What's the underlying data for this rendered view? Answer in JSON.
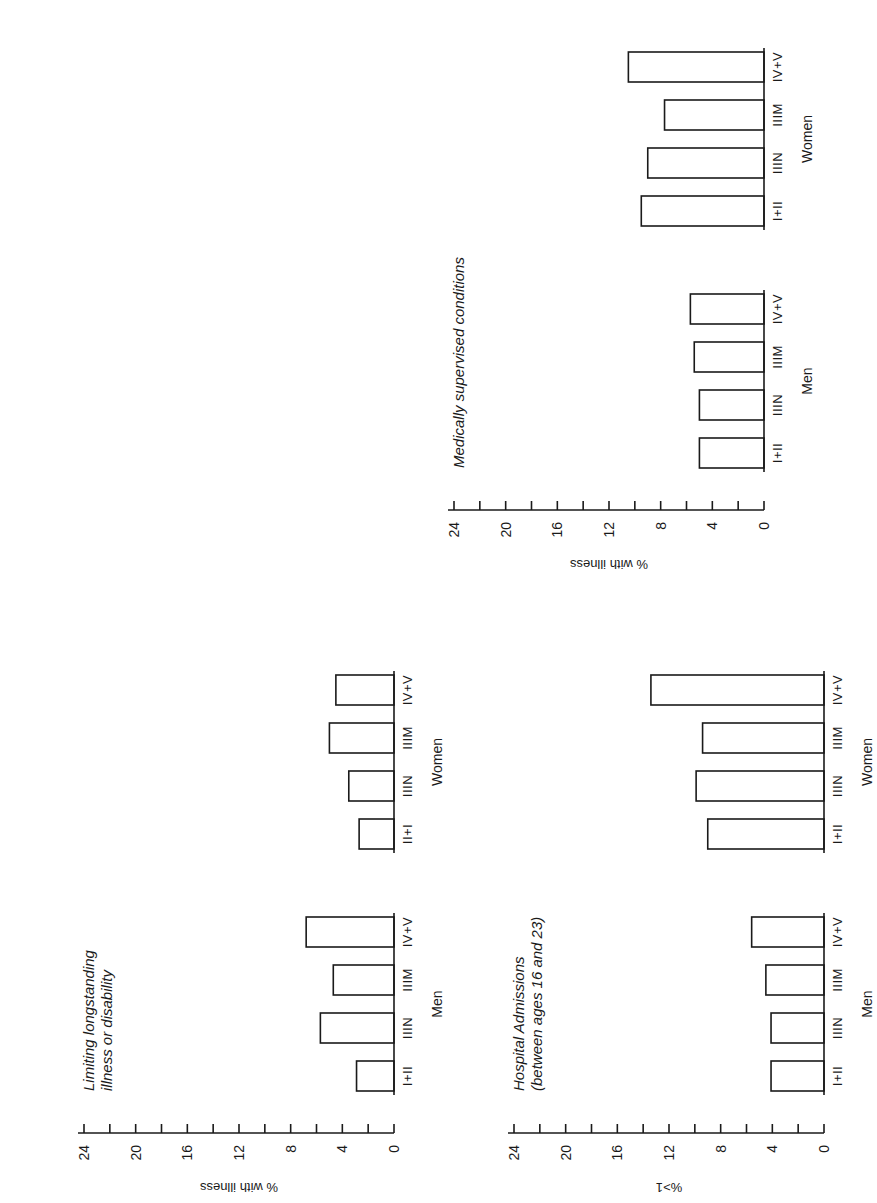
{
  "colors": {
    "ink": "#1a1a1a",
    "background": "#ffffff",
    "bar_fill": "#ffffff"
  },
  "chart_data": [
    {
      "type": "bar",
      "title": "Medically supervised conditions",
      "ylabel": "% with illness",
      "xlabel": "",
      "ylim": [
        0,
        24
      ],
      "yticks": [
        0,
        4,
        8,
        12,
        16,
        20,
        24
      ],
      "minor_tick_step": 2,
      "grid": false,
      "groups": [
        "Men",
        "Women"
      ],
      "categories": [
        "I+II",
        "IIIN",
        "IIIM",
        "IV+V"
      ],
      "series": [
        {
          "name": "Men",
          "values": [
            5.0,
            5.0,
            5.4,
            5.7
          ]
        },
        {
          "name": "Women",
          "values": [
            9.5,
            9.0,
            7.7,
            10.5
          ]
        }
      ]
    },
    {
      "type": "bar",
      "title": "Limiting longstanding illness or disability",
      "title_lines": [
        "Limiting longstanding",
        "illness or disability"
      ],
      "ylabel": "% with illness",
      "xlabel": "",
      "ylim": [
        0,
        24
      ],
      "yticks": [
        0,
        4,
        8,
        12,
        16,
        20,
        24
      ],
      "minor_tick_step": 2,
      "grid": false,
      "groups": [
        "Men",
        "Women"
      ],
      "categories": [
        "I+II",
        "IIIN",
        "IIIM",
        "IV+V"
      ],
      "women_category_labels": [
        "II+I",
        "IIIN",
        "IIIM",
        "IV+V"
      ],
      "series": [
        {
          "name": "Men",
          "values": [
            2.9,
            5.7,
            4.7,
            6.8
          ]
        },
        {
          "name": "Women",
          "values": [
            2.7,
            3.5,
            5.0,
            4.5
          ]
        }
      ]
    },
    {
      "type": "bar",
      "title": "Hospital Admissions (between ages 16 and 23)",
      "title_lines": [
        "Hospital Admissions",
        "(between ages 16 and 23)"
      ],
      "ylabel": "%>1",
      "xlabel": "",
      "ylim": [
        0,
        24
      ],
      "yticks": [
        0,
        4,
        8,
        12,
        16,
        20,
        24
      ],
      "minor_tick_step": 2,
      "grid": false,
      "groups": [
        "Men",
        "Women"
      ],
      "categories": [
        "I+II",
        "IIIN",
        "IIIM",
        "IV+V"
      ],
      "series": [
        {
          "name": "Men",
          "values": [
            4.1,
            4.1,
            4.5,
            5.6
          ]
        },
        {
          "name": "Women",
          "values": [
            9.0,
            9.9,
            9.4,
            13.4
          ]
        }
      ]
    }
  ],
  "layout": {
    "charts": [
      {
        "left": 392,
        "top": 572,
        "rotate": -90
      },
      {
        "left": 22,
        "top": 1195,
        "rotate": -90
      },
      {
        "left": 452,
        "top": 1195,
        "rotate": -90
      }
    ]
  }
}
